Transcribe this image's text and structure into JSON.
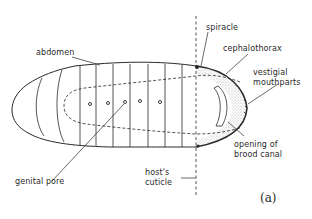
{
  "figure": {
    "panel_label": "(a)",
    "labels": {
      "abdomen": "abdomen",
      "spiracle": "spiracle",
      "cephalothorax": "cephalothorax",
      "vestigial_mouthparts_line1": "vestigial",
      "vestigial_mouthparts_line2": "mouthparts",
      "opening_line1": "opening of",
      "opening_line2": "brood canal",
      "genital_pore": "genital pore",
      "hosts_cuticle_line1": "host's",
      "hosts_cuticle_line2": "cuticle"
    },
    "genital_pore_count": 5,
    "colors": {
      "ink": "#2a2a2a",
      "stipple": "#9a9a9a",
      "background": "#ffffff"
    }
  }
}
